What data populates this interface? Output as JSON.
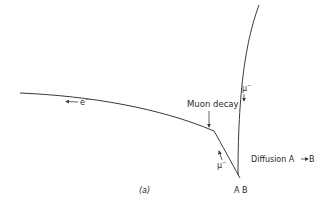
{
  "figure": {
    "panel_label": "(a)",
    "annotation_decay": "Muon decay",
    "annotation_diffusion": "Diffusion A",
    "diffusion_target": "B",
    "site_labels": "A B",
    "particles": {
      "electron": "e",
      "electron_charge": "−",
      "muon_left": "μ",
      "muon_left_charge": "−",
      "muon_right": "μ",
      "muon_right_charge": "−"
    },
    "colors": {
      "line": "#3a3a3a",
      "text": "#2a2a2a",
      "background": "#ffffff"
    }
  }
}
